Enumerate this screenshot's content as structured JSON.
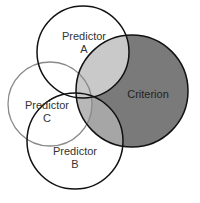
{
  "diagram": {
    "type": "venn",
    "circles": [
      {
        "id": "predictor_a",
        "label_line1": "Predictor",
        "label_line2": "A"
      },
      {
        "id": "predictor_b",
        "label_line1": "Predictor",
        "label_line2": "B"
      },
      {
        "id": "predictor_c",
        "label_line1": "Predictor",
        "label_line2": "C"
      },
      {
        "id": "criterion",
        "label_line1": "Criterion"
      }
    ],
    "colors": {
      "criterion_fill": "#7a7a7a",
      "overlap_a": "#c9c9c9",
      "overlap_b": "#a6a6a6",
      "overlap_c": "#b8b8b8",
      "stroke": "#111111",
      "stroke_c": "#8a8a8a"
    }
  }
}
